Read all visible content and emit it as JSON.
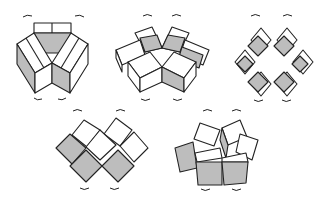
{
  "diagram": {
    "title": "",
    "colors": {
      "line": "#222222",
      "shade": "#bdbdbd",
      "background": "#ffffff"
    },
    "figures": [
      {
        "id": "fig-1",
        "description": "Folded cube ring, closed hexagonal prism-like form",
        "position": "top-left"
      },
      {
        "id": "fig-2",
        "description": "Ring of cubes partially unfolding",
        "position": "top-middle"
      },
      {
        "id": "fig-3",
        "description": "Cube ring flattened into diamond lattice",
        "position": "top-right"
      },
      {
        "id": "fig-4",
        "description": "Cube chain folding in zig-zag",
        "position": "bottom-left"
      },
      {
        "id": "fig-5",
        "description": "Cube chain curling into arch",
        "position": "bottom-right"
      }
    ],
    "annotations": "curved rotation arrows above and below each figure"
  }
}
